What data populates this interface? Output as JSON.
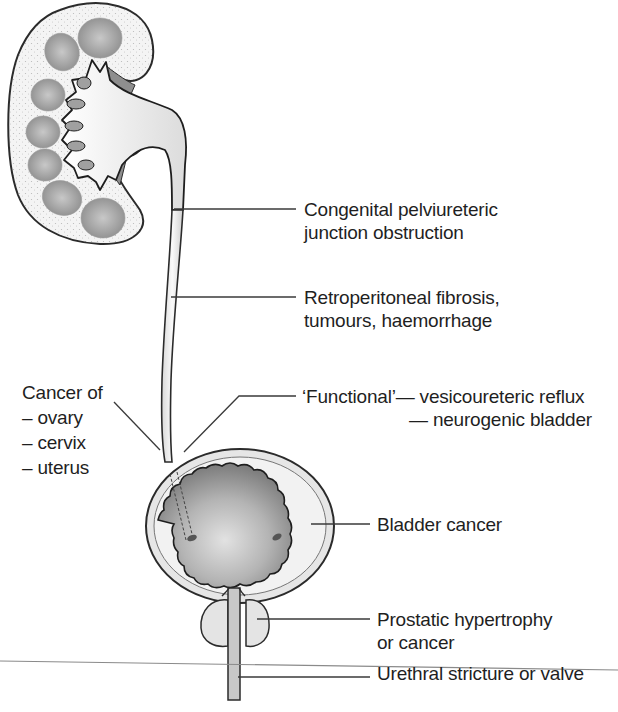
{
  "diagram": {
    "colors": {
      "outline": "#2b2b2b",
      "cortex": "#f1f1f1",
      "pyramid": "#9a9a9a",
      "bladder_lumen": "#a8a8a8",
      "leader": "#3a3a3a"
    }
  },
  "labels": {
    "pui": {
      "lines": [
        "Congenital pelviureteric",
        "junction obstruction"
      ]
    },
    "retro": {
      "lines": [
        "Retroperitoneal fibrosis,",
        "tumours, haemorrhage"
      ]
    },
    "functional": {
      "line1": "‘Functional’— vesicoureteric reflux",
      "line2": "— neurogenic bladder"
    },
    "cancer_of": {
      "title": "Cancer of",
      "items": [
        "– ovary",
        "– cervix",
        "– uterus"
      ]
    },
    "bladder": {
      "text": "Bladder cancer"
    },
    "prostate": {
      "lines": [
        "Prostatic hypertrophy",
        "or cancer"
      ]
    },
    "urethra": {
      "text": "Urethral stricture or valve"
    }
  }
}
